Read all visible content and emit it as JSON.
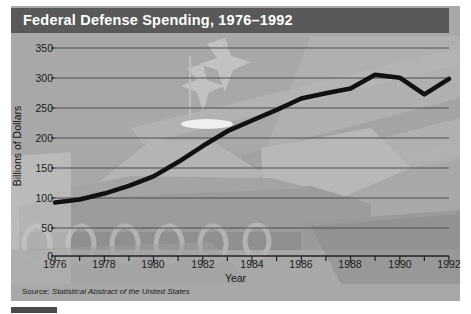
{
  "figure": {
    "title": "Federal Defense Spending, 1976–1992",
    "source_label": "Source:",
    "source_body": "Statistical Abstract of the United States",
    "caption_partial": "",
    "colors": {
      "title_bar": "#595959",
      "title_text": "#ffffff",
      "panel_background": "#a8a8a8",
      "line": "#111111",
      "gridline": "#555555",
      "axis": "#1a1a1a"
    }
  },
  "chart_data": {
    "type": "line",
    "title": "Federal Defense Spending, 1976–1992",
    "xlabel": "Year",
    "ylabel": "Billions of Dollars",
    "xlim": [
      1976,
      1992
    ],
    "ylim": [
      0,
      350
    ],
    "ytick_values": [
      0,
      50,
      100,
      150,
      200,
      250,
      300,
      350
    ],
    "ytick_labels": [
      "0",
      "50",
      "100",
      "150",
      "200",
      "250",
      "300",
      "350"
    ],
    "xtick_values": [
      1976,
      1978,
      1980,
      1982,
      1984,
      1986,
      1988,
      1990,
      1992
    ],
    "xtick_labels": [
      "1976",
      "1978",
      "1980",
      "1982",
      "1984",
      "1986",
      "1988",
      "1990",
      "1992"
    ],
    "minor_xtick_values": [
      1977,
      1979,
      1981,
      1983,
      1985,
      1987,
      1989,
      1991
    ],
    "grid": "horizontal",
    "legend": "none",
    "x": [
      1976,
      1977,
      1978,
      1979,
      1980,
      1981,
      1982,
      1983,
      1984,
      1985,
      1986,
      1987,
      1988,
      1989,
      1990,
      1991,
      1992
    ],
    "values": [
      90,
      95,
      105,
      118,
      134,
      158,
      185,
      210,
      228,
      246,
      265,
      274,
      282,
      305,
      300,
      272,
      298
    ],
    "series": [
      {
        "name": "Federal Defense Spending",
        "values": [
          90,
          95,
          105,
          118,
          134,
          158,
          185,
          210,
          228,
          246,
          265,
          274,
          282,
          305,
          300,
          272,
          298
        ]
      }
    ]
  }
}
